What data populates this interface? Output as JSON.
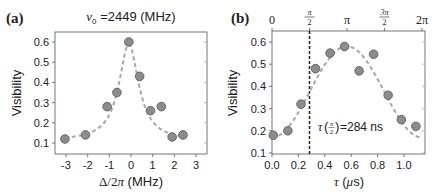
{
  "chart_data": [
    {
      "type": "scatter",
      "panel_label": "(a)",
      "title": "ν₀ =2449 (MHz)",
      "title_parts": {
        "symbol": "ν",
        "subscript": "0",
        "rest": " =2449 (MHz)"
      },
      "xlabel": "Δ/2π (MHz)",
      "ylabel": "Visibility",
      "xlim": [
        -3.5,
        3.5
      ],
      "ylim": [
        0.05,
        0.65
      ],
      "xticks": [
        -3,
        -2,
        -1,
        0,
        1,
        2,
        3
      ],
      "yticks": [
        0.1,
        0.2,
        0.3,
        0.4,
        0.5,
        0.6
      ],
      "ytick_labels": [
        "0.1",
        "0.2",
        "0.3",
        "0.4",
        "0.5",
        "0.6"
      ],
      "grid": false,
      "series": [
        {
          "name": "data",
          "kind": "points",
          "x": [
            -3.05,
            -2.1,
            -1.1,
            -0.65,
            -0.1,
            0.4,
            0.9,
            1.4,
            1.9,
            2.4
          ],
          "y": [
            0.12,
            0.14,
            0.28,
            0.35,
            0.6,
            0.43,
            0.26,
            0.28,
            0.13,
            0.14
          ]
        },
        {
          "name": "Lorentzian fit",
          "kind": "dashed-line",
          "model": "lorentzian",
          "params": {
            "center": -0.1,
            "amplitude": 0.48,
            "hwhm": 0.55,
            "offset": 0.11
          },
          "x_range": [
            -3.05,
            2.4
          ]
        }
      ],
      "colors": {
        "point_fill": "#8c8c8c",
        "point_stroke": "#5e5e5e",
        "fit": "#a8a8a8",
        "axis": "#444444"
      }
    },
    {
      "type": "scatter",
      "panel_label": "(b)",
      "xlabel": "τ (μs)",
      "ylabel": "Visibility",
      "xlim": [
        0.0,
        1.16
      ],
      "ylim": [
        0.1,
        0.65
      ],
      "xticks": [
        0.0,
        0.2,
        0.4,
        0.6,
        0.8,
        1.0
      ],
      "xtick_labels": [
        "0.0",
        "0.2",
        "0.4",
        "0.6",
        "0.8",
        "1.0"
      ],
      "yticks": [
        0.1,
        0.2,
        0.3,
        0.4,
        0.5,
        0.6
      ],
      "ytick_labels": [
        "0.1",
        "0.2",
        "0.3",
        "0.4",
        "0.5",
        "0.6"
      ],
      "top_axis": {
        "ticks": [
          0.0,
          0.284,
          0.568,
          0.852,
          1.136
        ],
        "labels": [
          "0",
          "π/2",
          "π",
          "3π/2",
          "2π"
        ]
      },
      "grid": false,
      "annotation": {
        "text_prefix": "τ",
        "frac_num": "π",
        "frac_den": "2",
        "text_suffix": " =284 ns",
        "x": 0.33,
        "y": 0.22
      },
      "vline": {
        "x": 0.284,
        "style": "dashed",
        "color": "#222222"
      },
      "series": [
        {
          "name": "data",
          "kind": "points",
          "x": [
            0.01,
            0.12,
            0.22,
            0.33,
            0.44,
            0.55,
            0.66,
            0.77,
            0.88,
            0.98,
            1.09
          ],
          "y": [
            0.18,
            0.2,
            0.32,
            0.48,
            0.55,
            0.58,
            0.47,
            0.545,
            0.36,
            0.25,
            0.22
          ]
        },
        {
          "name": "sinusoidal fit",
          "kind": "dashed-line",
          "model": "cosine",
          "params": {
            "offset": 0.375,
            "amplitude": 0.205,
            "period": 1.136,
            "phase_x": 0.568
          },
          "x_range": [
            0.0,
            1.14
          ]
        }
      ],
      "colors": {
        "point_fill": "#8c8c8c",
        "point_stroke": "#5e5e5e",
        "fit": "#a8a8a8",
        "axis": "#444444"
      }
    }
  ]
}
